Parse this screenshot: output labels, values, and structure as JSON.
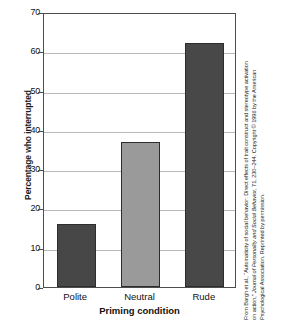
{
  "chart_data": {
    "type": "bar",
    "title": "",
    "categories": [
      "Polite",
      "Neutral",
      "Rude"
    ],
    "values": [
      16,
      37,
      62
    ],
    "xlabel": "Priming condition",
    "ylabel": "Percentage who interrupted",
    "ylim": [
      0,
      70
    ],
    "yticks": [
      0,
      10,
      20,
      30,
      40,
      50,
      60,
      70
    ],
    "ytick_labels": [
      "0",
      "10",
      "20",
      "30",
      "40",
      "50",
      "60",
      "70"
    ],
    "grid": true,
    "legend": "none",
    "bar_colors": [
      "#474747",
      "#9a9a9a",
      "#484848"
    ],
    "bar_edge_color": "#2d2d2d",
    "frame_color": "#4d4d4d",
    "gridline_color": "#b9b9b9",
    "background": "#ffffff"
  },
  "axes": {
    "y_title": "Percentage who interrupted",
    "x_title": "Priming condition",
    "y_ticks": [
      {
        "label": "70",
        "value": 70
      },
      {
        "label": "60",
        "value": 60
      },
      {
        "label": "50",
        "value": 50
      },
      {
        "label": "40",
        "value": 40
      },
      {
        "label": "30",
        "value": 30
      },
      {
        "label": "20",
        "value": 20
      },
      {
        "label": "10",
        "value": 10
      },
      {
        "label": "0",
        "value": 0
      }
    ],
    "x_ticks": [
      {
        "label": "Polite"
      },
      {
        "label": "Neutral"
      },
      {
        "label": "Rude"
      }
    ]
  },
  "source_credit": {
    "line1": "From Bargh et al., “Automaticity of social behavior: Direct effects of trait construct and stereotype activation",
    "line2": "on action,” Journal of Personality and Social Behavior, 71, 230–244. Copyright © 1996 by the American",
    "line3": "Psychological Association. Reprinted by permission."
  }
}
